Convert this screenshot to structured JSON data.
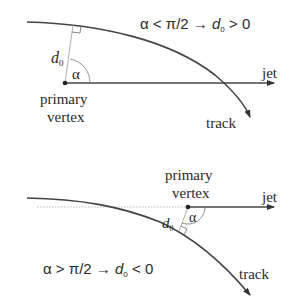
{
  "top_panel": {
    "condition": {
      "alpha": "α",
      "relation": "<",
      "threshold": "π/2",
      "arrow": "→",
      "d": "d",
      "sub": "0",
      "result": "> 0"
    },
    "labels": {
      "d0": "d",
      "d0_sub": "0",
      "alpha": "α",
      "vertex_line1": "primary",
      "vertex_line2": "vertex",
      "jet": "jet",
      "track": "track"
    }
  },
  "bottom_panel": {
    "condition": {
      "alpha": "α",
      "relation": ">",
      "threshold": "π/2",
      "arrow": "→",
      "d": "d",
      "sub": "0",
      "result": "< 0"
    },
    "labels": {
      "d0": "d",
      "d0_sub": "0",
      "alpha": "α",
      "vertex_line1": "primary",
      "vertex_line2": "vertex",
      "jet": "jet",
      "track": "track"
    }
  },
  "colors": {
    "line": "#444444",
    "dotted": "#aaaaaa",
    "text": "#2a2a2a"
  }
}
